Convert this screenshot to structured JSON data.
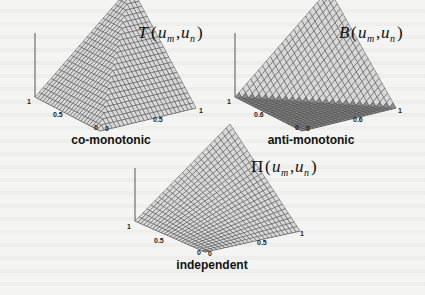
{
  "figure": {
    "panels": [
      {
        "id": "comonotonic",
        "function_symbol": "T",
        "function_args": [
          "u",
          "m",
          "u",
          "n"
        ],
        "label": "T(u_m,u_n)",
        "caption": "co-monotonic",
        "surface": "min(u_m, u_n)",
        "ticks": {
          "z_top": "1",
          "x_left": "0.5",
          "x_origin": "0",
          "y_origin": "0",
          "y_mid": "0.5",
          "y_right": "1"
        }
      },
      {
        "id": "antimonotonic",
        "function_symbol": "B",
        "function_args": [
          "u",
          "m",
          "u",
          "n"
        ],
        "label": "B(u_m,u_n)",
        "caption": "anti-monotonic",
        "surface": "max(u_m + u_n - 1, 0)",
        "ticks": {
          "z_top": "1",
          "x_left": "0.6",
          "x_origin": "0",
          "y_origin": "0",
          "y_mid": "0.6",
          "y_right": "1"
        }
      },
      {
        "id": "independent",
        "function_symbol": "Π",
        "function_args": [
          "u",
          "m",
          "u",
          "n"
        ],
        "label": "Π(u_m,u_n)",
        "caption": "independent",
        "surface": "u_m * u_n",
        "ticks": {
          "z_top": "1",
          "x_left": "0.5",
          "x_origin": "0",
          "y_origin": "0",
          "y_mid": "0.5",
          "y_right": "1"
        }
      }
    ],
    "colors": {
      "mesh_line": "#3a3a3a",
      "surface_fill": "#d8d8d8",
      "surface_shadow": "#8a8a8a",
      "axis": "#555555"
    }
  }
}
